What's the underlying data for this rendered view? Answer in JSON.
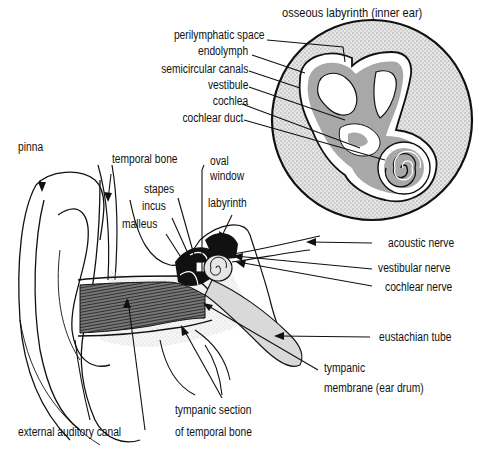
{
  "diagram": {
    "title": "osseous labyrinth (inner ear)",
    "colors": {
      "ink": "#111111",
      "gray_fill": "#bdbdbd",
      "light_gray": "#e2e2e2",
      "canal_dark": "#3a3a3a",
      "background": "#ffffff"
    },
    "inset_labels": [
      {
        "text": "perilymphatic space"
      },
      {
        "text": "endolymph"
      },
      {
        "text": "semicircular canals"
      },
      {
        "text": "vestibule"
      },
      {
        "text": "cochlea"
      },
      {
        "text": "cochlear duct"
      }
    ],
    "ear_labels": {
      "pinna": "pinna",
      "temporal_bone": "temporal bone",
      "oval_window_1": "oval",
      "oval_window_2": "window",
      "stapes": "stapes",
      "incus": "incus",
      "malleus": "malleus",
      "labyrinth": "labyrinth",
      "acoustic_nerve": "acoustic nerve",
      "vestibular_nerve": "vestibular nerve",
      "cochlear_nerve": "cochlear nerve",
      "eustachian_tube": "eustachian tube",
      "tympanic_membrane_1": "tympanic",
      "tympanic_membrane_2": "membrane (ear drum)",
      "external_auditory_canal": "external auditory canal",
      "tympanic_section_1": "tympanic section",
      "tympanic_section_2": "of temporal bone"
    }
  }
}
